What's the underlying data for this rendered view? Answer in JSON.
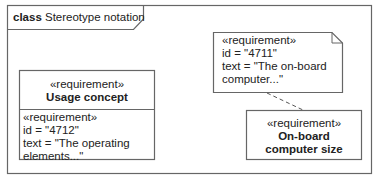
{
  "frame": {
    "keyword": "class",
    "title": "Stereotype notation"
  },
  "note": {
    "stereotype": "«requirement»",
    "id_line": "id = \"4711\"",
    "text_line1": "text = \"The on-board",
    "text_line2": "computer...\""
  },
  "usage_concept": {
    "header_stereotype": "«requirement»",
    "name": "Usage concept",
    "compartment_stereotype": "«requirement»",
    "id_line": "id = \"4712\"",
    "text_line1": "text = \"The operating",
    "text_line2": "elements...\""
  },
  "onboard": {
    "stereotype": "«requirement»",
    "name_line1": "On-board",
    "name_line2": "computer size"
  },
  "colors": {
    "line": "#555555",
    "text": "#222222",
    "background": "#ffffff"
  }
}
